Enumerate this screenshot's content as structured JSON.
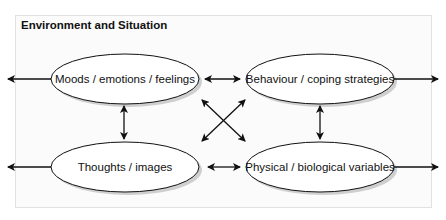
{
  "title": "Environment and Situation",
  "nodes": [
    {
      "id": "moods",
      "label": "Moods / emotions / feelings"
    },
    {
      "id": "behaviour",
      "label": "Behaviour / coping strategies"
    },
    {
      "id": "thoughts",
      "label": "Thoughts / images"
    },
    {
      "id": "physical",
      "label": "Physical / biological variables"
    }
  ],
  "colors": {
    "stroke": "#111111",
    "frame": "#e2e2e2",
    "shadow": "#c8c8c8"
  }
}
